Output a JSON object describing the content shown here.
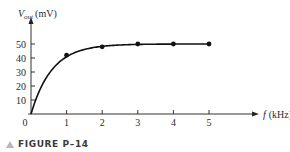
{
  "chart_data": {
    "type": "line",
    "title": "",
    "ylabel": {
      "symbol": "V",
      "subscript": "out",
      "unit": "(mV)"
    },
    "xlabel": {
      "symbol": "f",
      "unit": "(kHz)"
    },
    "x": [
      0,
      1,
      2,
      3,
      4,
      5
    ],
    "series": [
      {
        "name": "V_out",
        "x": [
          0,
          1,
          2,
          3,
          4,
          5
        ],
        "values": [
          0,
          42,
          48,
          50,
          50,
          50
        ],
        "markers_at": [
          1,
          2,
          3,
          4,
          5
        ]
      }
    ],
    "xticks": [
      "0",
      "1",
      "2",
      "3",
      "4",
      "5"
    ],
    "yticks": [
      "10",
      "20",
      "30",
      "40",
      "50"
    ],
    "xlim": [
      0,
      5.2
    ],
    "ylim": [
      0,
      55
    ],
    "grid": false,
    "legend": null
  },
  "caption": {
    "label": "FIGURE P–14"
  }
}
